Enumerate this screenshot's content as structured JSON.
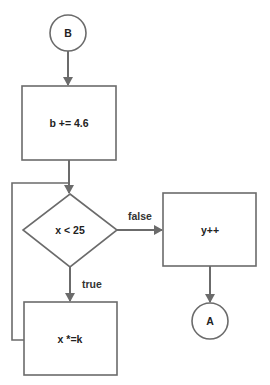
{
  "diagram": {
    "type": "flowchart",
    "colors": {
      "stroke": "#6b6b6b",
      "text": "#222222",
      "background": "#ffffff"
    },
    "nodes": {
      "connector_b": {
        "shape": "circle",
        "label": "B"
      },
      "process_b_add": {
        "shape": "rectangle",
        "label": "b += 4.6"
      },
      "decision_x_lt_25": {
        "shape": "diamond",
        "label": "x < 25"
      },
      "process_y_inc": {
        "shape": "rectangle",
        "label": "y++"
      },
      "process_x_mul": {
        "shape": "rectangle",
        "label": "x *=k"
      },
      "connector_a": {
        "shape": "circle",
        "label": "A"
      }
    },
    "edges": {
      "b_to_add": {
        "from": "B",
        "to": "b += 4.6",
        "label": ""
      },
      "add_to_decision": {
        "from": "b += 4.6",
        "to": "x < 25",
        "label": ""
      },
      "decision_false": {
        "from": "x < 25",
        "to": "y++",
        "label": "false"
      },
      "decision_true": {
        "from": "x < 25",
        "to": "x *=k",
        "label": "true"
      },
      "y_to_a": {
        "from": "y++",
        "to": "A",
        "label": ""
      },
      "loop_back": {
        "from": "x *=k",
        "to": "x < 25",
        "label": ""
      }
    }
  }
}
